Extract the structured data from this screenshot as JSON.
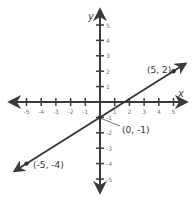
{
  "chart_data": {
    "type": "line",
    "title": "",
    "xlabel": "x",
    "ylabel": "y",
    "xlim": [
      -5,
      5
    ],
    "ylim": [
      -5,
      5
    ],
    "grid": false,
    "x_ticks": [
      -5,
      -4,
      -3,
      -2,
      -1,
      1,
      2,
      3,
      4,
      5
    ],
    "y_ticks": [
      5,
      4,
      3,
      2,
      1,
      -1,
      -2,
      -3,
      -4,
      -5
    ],
    "series": [
      {
        "name": "line",
        "equation": "y = 0.6x - 1",
        "x": [
          -5,
          0,
          5
        ],
        "y": [
          -4,
          -1,
          2
        ],
        "arrows_both_ends": true
      }
    ],
    "annotations": [
      {
        "text": "(5, 2)",
        "x": 5,
        "y": 2
      },
      {
        "text": "(0, -1)",
        "x": 0,
        "y": -1
      },
      {
        "text": "(-5, -4)",
        "x": -5,
        "y": -4
      }
    ],
    "colors": {
      "axis": "#3a3a3a",
      "line": "#333333",
      "text": "#777777"
    }
  }
}
